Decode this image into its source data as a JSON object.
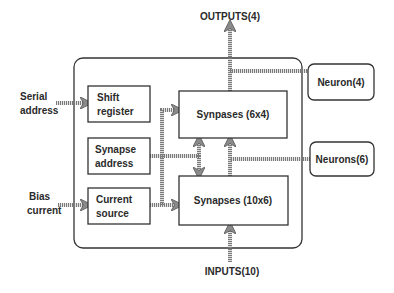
{
  "diagram": {
    "outputs_label": "OUTPUTS(4)",
    "inputs_label": "INPUTS(10)",
    "external_inputs": {
      "serial_address": [
        "Serial",
        "address"
      ],
      "bias_current": [
        "Bias",
        "current"
      ]
    },
    "blocks": {
      "shift_register": [
        "Shift",
        "register"
      ],
      "synapse_address": [
        "Synapse",
        "address"
      ],
      "current_source": [
        "Current",
        "source"
      ],
      "synapses_top": "Synpases (6x4)",
      "synapses_bottom": "Synapses (10x6)"
    },
    "neurons": {
      "neuron_4": "Neuron(4)",
      "neurons_6": "Neurons(6)"
    }
  }
}
